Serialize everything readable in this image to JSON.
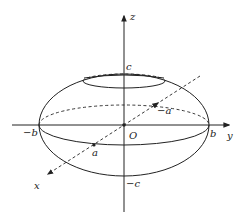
{
  "diagram": {
    "type": "ellipsoid",
    "labels": {
      "z_axis": "z",
      "y_axis": "y",
      "x_axis": "x",
      "origin": "O",
      "top": "c",
      "bottom": "−c",
      "left": "−b",
      "right": "b",
      "front": "a",
      "back": "−a"
    },
    "colors": {
      "stroke": "#222222",
      "background": "#ffffff"
    }
  }
}
